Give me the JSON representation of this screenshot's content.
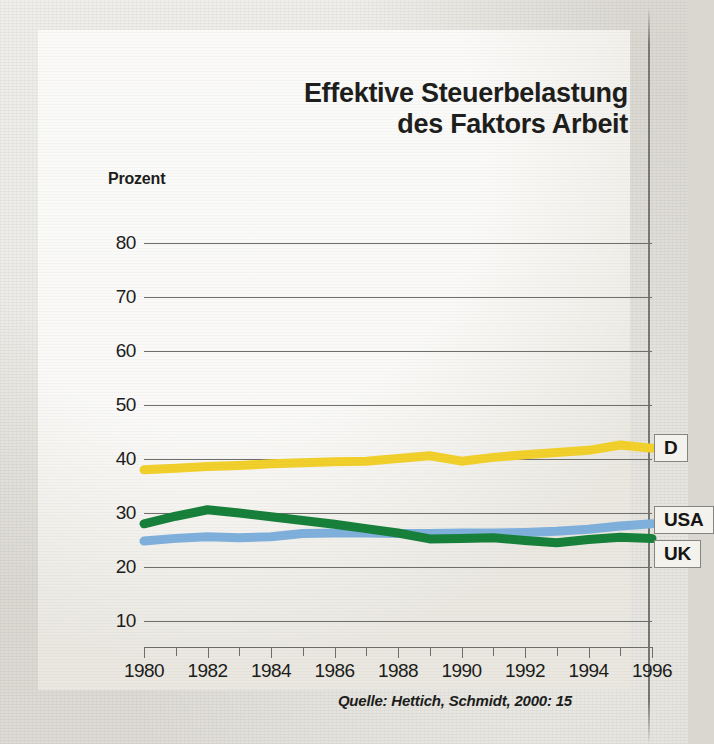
{
  "figure": {
    "title_line1": "Effektive Steuerbelastung",
    "title_line2": "des Faktors Arbeit",
    "axis_unit_label": "Prozent",
    "source": "Quelle: Hettich, Schmidt, 2000: 15"
  },
  "colors": {
    "germany": "#F2D02B",
    "usa": "#7FB0DC",
    "uk": "#17803A",
    "gridline": "#6E6E6A",
    "text": "#1D1D1B",
    "panel": "#EEECE6",
    "page": "#D9D7D0"
  },
  "legend": [
    {
      "label": "D",
      "series": "germany",
      "color": "#F2D02B"
    },
    {
      "label": "USA",
      "series": "usa",
      "color": "#7FB0DC"
    },
    {
      "label": "UK",
      "series": "uk",
      "color": "#17803A"
    }
  ],
  "chart_data": {
    "type": "line",
    "title": "Effektive Steuerbelastung des Faktors Arbeit",
    "xlabel": "",
    "ylabel": "Prozent",
    "xlim": [
      1980,
      1996
    ],
    "ylim": [
      5,
      85
    ],
    "yticks": [
      10,
      20,
      30,
      40,
      50,
      60,
      70,
      80
    ],
    "xticks": [
      1980,
      1981,
      1982,
      1983,
      1984,
      1985,
      1986,
      1987,
      1988,
      1989,
      1990,
      1991,
      1992,
      1993,
      1994,
      1995,
      1996
    ],
    "xticklabels": [
      "1980",
      "",
      "1982",
      "",
      "1984",
      "",
      "1986",
      "",
      "1988",
      "",
      "1990",
      "",
      "1992",
      "",
      "1994",
      "",
      "1996"
    ],
    "grid": "horizontal",
    "legend_position": "right-inline",
    "x": [
      1980,
      1981,
      1982,
      1983,
      1984,
      1985,
      1986,
      1987,
      1988,
      1989,
      1990,
      1991,
      1992,
      1993,
      1994,
      1995,
      1996
    ],
    "series": [
      {
        "name": "D",
        "country": "Deutschland",
        "color": "#F2D02B",
        "values": [
          38.0,
          38.3,
          38.6,
          38.8,
          39.1,
          39.3,
          39.5,
          39.6,
          40.1,
          40.6,
          39.6,
          40.3,
          40.8,
          41.2,
          41.6,
          42.6,
          42.0
        ]
      },
      {
        "name": "USA",
        "color": "#7FB0DC",
        "values": [
          24.8,
          25.3,
          25.6,
          25.4,
          25.6,
          26.2,
          26.3,
          26.3,
          26.2,
          26.2,
          26.3,
          26.3,
          26.4,
          26.6,
          27.0,
          27.6,
          28.0
        ]
      },
      {
        "name": "UK",
        "color": "#17803A",
        "values": [
          28.0,
          29.4,
          30.6,
          30.0,
          29.3,
          28.6,
          27.9,
          27.1,
          26.3,
          25.2,
          25.3,
          25.4,
          24.9,
          24.5,
          25.1,
          25.5,
          25.3
        ]
      }
    ]
  }
}
